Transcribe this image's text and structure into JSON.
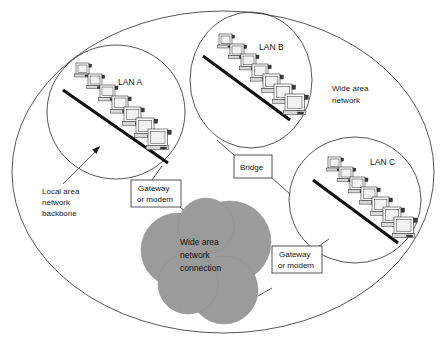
{
  "diagram": {
    "outer_label": "Wide area network",
    "lans": [
      {
        "id": "lan-a",
        "label": "LAN A",
        "node_count": 7
      },
      {
        "id": "lan-b",
        "label": "LAN B",
        "node_count": 7
      },
      {
        "id": "lan-c",
        "label": "LAN C",
        "node_count": 7
      }
    ],
    "annotations": {
      "backbone_line1": "Local area",
      "backbone_line2": "network",
      "backbone_line3": "backbone",
      "wan_line1": "Wide area",
      "wan_line2": "network"
    },
    "boxes": [
      {
        "id": "gateway-left",
        "line1": "Gateway",
        "line2": "or modem"
      },
      {
        "id": "bridge",
        "line1": "Bridge",
        "line2": ""
      },
      {
        "id": "gateway-right",
        "line1": "Gateway",
        "line2": "or modem"
      }
    ],
    "cloud": {
      "line1": "Wide area",
      "line2": "network",
      "line3": "connection",
      "color": "#9b9b9b"
    },
    "colors": {
      "stroke": "#2b2b2b",
      "backbone": "#111111",
      "cloud_fill": "#9b9b9b",
      "background": "#ffffff",
      "text": "#111111"
    }
  }
}
